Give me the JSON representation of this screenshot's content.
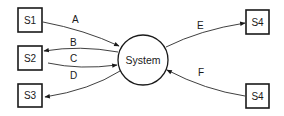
{
  "diagram": {
    "type": "context-diagram",
    "center": {
      "label": "System"
    },
    "entities": [
      {
        "id": "s1",
        "label": "S1"
      },
      {
        "id": "s2",
        "label": "S2"
      },
      {
        "id": "s3",
        "label": "S3"
      },
      {
        "id": "s4a",
        "label": "S4"
      },
      {
        "id": "s4b",
        "label": "S4"
      }
    ],
    "flows": [
      {
        "id": "A",
        "label": "A",
        "from": "S1",
        "to": "System"
      },
      {
        "id": "B",
        "label": "B",
        "from": "System",
        "to": "S2"
      },
      {
        "id": "C",
        "label": "C",
        "from": "S2",
        "to": "System"
      },
      {
        "id": "D",
        "label": "D",
        "from": "System",
        "to": "S3"
      },
      {
        "id": "E",
        "label": "E",
        "from": "System",
        "to": "S4"
      },
      {
        "id": "F",
        "label": "F",
        "from": "S4",
        "to": "System"
      }
    ]
  }
}
